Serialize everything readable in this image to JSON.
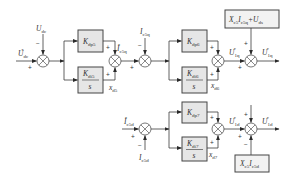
{
  "diagram": {
    "title": "",
    "colors": {
      "line": "#3a3a3a",
      "block_fill": "#e6e6e6",
      "box_fill": "#f2f2f2"
    },
    "inputs": {
      "udc_ref": {
        "main": "U",
        "sub": "dc",
        "sup": "*"
      },
      "udc": {
        "main": "U",
        "sub": "dc"
      },
      "ic5q": {
        "main": "I",
        "sub": "c5q"
      },
      "ic5d_ref": {
        "main": "I",
        "sub": "c5d",
        "sup": "*"
      },
      "ic5d": {
        "main": "I",
        "sub": "c5d"
      }
    },
    "blocks": {
      "kdp5": {
        "main": "K",
        "sub": "dp5"
      },
      "kdi5": {
        "main": "K",
        "sub": "di5",
        "den": "s"
      },
      "kdp6": {
        "main": "K",
        "sub": "dp6"
      },
      "kdi6": {
        "main": "K",
        "sub": "di6",
        "den": "s"
      },
      "kdp7": {
        "main": "K",
        "sub": "dp7"
      },
      "kdi7": {
        "main": "K",
        "sub": "di7",
        "den": "s"
      }
    },
    "states": {
      "xd5": {
        "main": "x",
        "sub": "d5"
      },
      "xd6": {
        "main": "x",
        "sub": "d6"
      },
      "xd7": {
        "main": "x",
        "sub": "d7"
      }
    },
    "signals": {
      "ic5q_ref": {
        "main": "I",
        "sub": "c5q",
        "sup": "*"
      },
      "u1q_ref_pi": {
        "main": "U",
        "sub": "1q",
        "sup": "*"
      },
      "u1q_ref": {
        "main": "U",
        "sub": "1q",
        "sup": "*"
      },
      "u1d_ref_pi": {
        "main": "U",
        "sub": "1d",
        "sup": "*"
      },
      "u1d_ref": {
        "main": "U",
        "sub": "1d",
        "sup": "*"
      }
    },
    "feedforward": {
      "q_axis": "X c5 I c5q + U ds",
      "q_parts": [
        {
          "main": "X",
          "sub": "c5"
        },
        {
          "main": "I",
          "sub": "c5q"
        },
        {
          "main": "+U",
          "sub": "ds"
        }
      ],
      "d_axis": "X c5 I c5d",
      "d_parts": [
        {
          "main": "X",
          "sub": "c5"
        },
        {
          "main": "I",
          "sub": "c5d"
        }
      ]
    },
    "signs": {
      "plus": "+",
      "minus": "−"
    }
  }
}
